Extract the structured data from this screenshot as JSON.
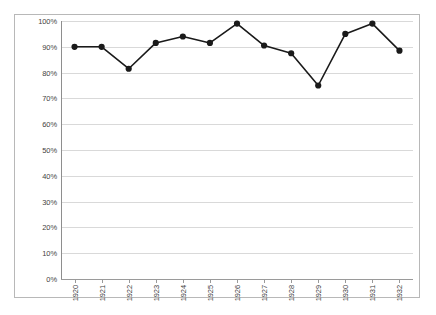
{
  "chart_data": {
    "type": "line",
    "title": "",
    "subtitle": "",
    "xlabel": "",
    "ylabel": "",
    "categories": [
      "1920",
      "1921",
      "1922",
      "1923",
      "1924",
      "1925",
      "1926",
      "1927",
      "1928",
      "1929",
      "1930",
      "1931",
      "1932"
    ],
    "values": [
      90,
      90,
      81.5,
      91.5,
      94,
      91.5,
      99,
      90.5,
      87.5,
      75,
      95,
      99,
      88.5
    ],
    "series": [
      {
        "name": "",
        "values": [
          90,
          90,
          81.5,
          91.5,
          94,
          91.5,
          99,
          90.5,
          87.5,
          75,
          95,
          99,
          88.5
        ]
      }
    ],
    "ylim": [
      0,
      100
    ],
    "ytick_step": 10,
    "ytick_labels": [
      "0%",
      "10%",
      "20%",
      "30%",
      "40%",
      "50%",
      "60%",
      "70%",
      "80%",
      "90%",
      "100%"
    ],
    "ytick_values": [
      0,
      10,
      20,
      30,
      40,
      50,
      60,
      70,
      80,
      90,
      100
    ],
    "grid": true,
    "grid_axis": "y",
    "legend": false,
    "legend_position": "none",
    "marker": "circle",
    "series_color": "#1a1a1a",
    "grid_color": "#d9d9d9",
    "axis_color": "#8e8e8e",
    "frame_color": "#b8b8b8",
    "background_color": "#ffffff",
    "xtick_label_rotation": 90
  }
}
